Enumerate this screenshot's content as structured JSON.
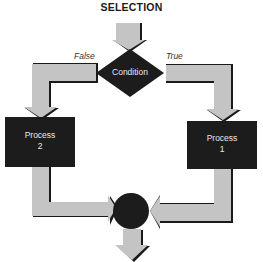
{
  "diagram": {
    "title": "SELECTION",
    "decision": {
      "label": "Condition"
    },
    "branches": {
      "false_label": "False",
      "true_label": "True"
    },
    "processes": [
      {
        "id": "process-2",
        "line1": "Process",
        "line2": "2"
      },
      {
        "id": "process-1",
        "line1": "Process",
        "line2": "1"
      }
    ],
    "colors": {
      "arrow_fill": "#c4c4c4",
      "arrow_shadow": "#1a1a1a",
      "shape_fill": "#1c1c1c",
      "text_on_shape": "#e8e8e8"
    }
  }
}
